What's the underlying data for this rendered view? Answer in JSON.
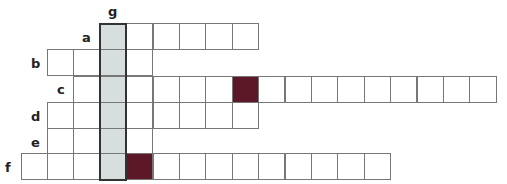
{
  "puzzle": {
    "type": "crossword-keyword",
    "highlight_column_label": "g",
    "colors": {
      "highlight": "#d6dfdd",
      "dark_cell": "#5c1826",
      "border": "#777777"
    },
    "cell_size": 26.4,
    "origin_x": 20.5,
    "highlight_col_index": 3,
    "rows": [
      {
        "label": "a",
        "start_col": 3,
        "length": 6,
        "dark": [],
        "top": 23,
        "label_x": 82,
        "label_y": 31
      },
      {
        "label": "b",
        "start_col": 1,
        "length": 4,
        "dark": [],
        "top": 49,
        "label_x": 31,
        "label_y": 57
      },
      {
        "label": "c",
        "start_col": 2,
        "length": 16,
        "dark": [
          8
        ],
        "top": 75.5,
        "label_x": 57,
        "label_y": 83
      },
      {
        "label": "d",
        "start_col": 1,
        "length": 8,
        "dark": [],
        "top": 102,
        "label_x": 31,
        "label_y": 110
      },
      {
        "label": "e",
        "start_col": 1,
        "length": 4,
        "dark": [],
        "top": 128,
        "label_x": 31,
        "label_y": 136
      },
      {
        "label": "f",
        "start_col": 0,
        "length": 14,
        "dark": [
          4
        ],
        "top": 153,
        "label_x": 5,
        "label_y": 161
      }
    ],
    "g_label": {
      "text": "g",
      "x": 108,
      "y": 5
    }
  }
}
